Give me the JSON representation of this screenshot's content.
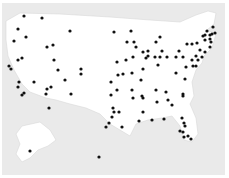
{
  "map": {
    "title": "",
    "region": "United States",
    "colors": {
      "background": "#eaeaea",
      "land": "#ffffff",
      "border": "#d8d8d8",
      "marker": "#111111"
    },
    "land_paths": {
      "conus": "M6,21 L20,13 L60,14 L110,17 L150,20 L180,22 L196,15 L208,11 L216,13 L214,24 L207,30 L216,34 L212,48 L204,56 L202,63 L196,70 L192,82 L194,96 L190,104 L196,118 L198,134 L192,142 L184,140 L180,126 L172,116 L162,118 L148,120 L136,124 L130,136 L120,130 L110,124 L100,114 L86,108 L70,104 L56,100 L46,98 L30,92 L22,84 L14,70 L8,56 L6,40 Z",
      "alaska": "M22,126 L40,122 L50,130 L56,140 L48,146 L38,150 L30,158 L22,162 L16,154 L20,144 L16,134 Z"
    },
    "markers": [
      {
        "x": 24,
        "y": 16
      },
      {
        "x": 42,
        "y": 18
      },
      {
        "x": 18,
        "y": 29
      },
      {
        "x": 70,
        "y": 31
      },
      {
        "x": 114,
        "y": 32
      },
      {
        "x": 14,
        "y": 41
      },
      {
        "x": 26,
        "y": 37
      },
      {
        "x": 47,
        "y": 47
      },
      {
        "x": 53,
        "y": 45
      },
      {
        "x": 54,
        "y": 60
      },
      {
        "x": 18,
        "y": 60
      },
      {
        "x": 22,
        "y": 58
      },
      {
        "x": 9,
        "y": 66
      },
      {
        "x": 11,
        "y": 69
      },
      {
        "x": 58,
        "y": 70
      },
      {
        "x": 81,
        "y": 69
      },
      {
        "x": 81,
        "y": 74
      },
      {
        "x": 65,
        "y": 80
      },
      {
        "x": 19,
        "y": 82
      },
      {
        "x": 18,
        "y": 87
      },
      {
        "x": 34,
        "y": 82
      },
      {
        "x": 51,
        "y": 87
      },
      {
        "x": 111,
        "y": 82
      },
      {
        "x": 131,
        "y": 31
      },
      {
        "x": 127,
        "y": 42
      },
      {
        "x": 134,
        "y": 42
      },
      {
        "x": 136,
        "y": 47
      },
      {
        "x": 143,
        "y": 52
      },
      {
        "x": 148,
        "y": 51
      },
      {
        "x": 156,
        "y": 42
      },
      {
        "x": 160,
        "y": 37
      },
      {
        "x": 148,
        "y": 56
      },
      {
        "x": 146,
        "y": 58
      },
      {
        "x": 155,
        "y": 57
      },
      {
        "x": 160,
        "y": 57
      },
      {
        "x": 162,
        "y": 51
      },
      {
        "x": 167,
        "y": 57
      },
      {
        "x": 176,
        "y": 57
      },
      {
        "x": 183,
        "y": 57
      },
      {
        "x": 179,
        "y": 51
      },
      {
        "x": 187,
        "y": 44
      },
      {
        "x": 192,
        "y": 44
      },
      {
        "x": 197,
        "y": 43
      },
      {
        "x": 203,
        "y": 36
      },
      {
        "x": 205,
        "y": 35
      },
      {
        "x": 205,
        "y": 40
      },
      {
        "x": 210,
        "y": 35
      },
      {
        "x": 210,
        "y": 39
      },
      {
        "x": 210,
        "y": 47
      },
      {
        "x": 205,
        "y": 52
      },
      {
        "x": 200,
        "y": 50
      },
      {
        "x": 196,
        "y": 56
      },
      {
        "x": 202,
        "y": 57
      },
      {
        "x": 198,
        "y": 60
      },
      {
        "x": 192,
        "y": 60
      },
      {
        "x": 193,
        "y": 66
      },
      {
        "x": 117,
        "y": 62
      },
      {
        "x": 126,
        "y": 60
      },
      {
        "x": 133,
        "y": 57
      },
      {
        "x": 118,
        "y": 75
      },
      {
        "x": 123,
        "y": 74
      },
      {
        "x": 132,
        "y": 73
      },
      {
        "x": 143,
        "y": 69
      },
      {
        "x": 158,
        "y": 65
      },
      {
        "x": 176,
        "y": 73
      },
      {
        "x": 185,
        "y": 79
      },
      {
        "x": 196,
        "y": 66
      },
      {
        "x": 211,
        "y": 42
      },
      {
        "x": 212,
        "y": 34
      },
      {
        "x": 207,
        "y": 31
      },
      {
        "x": 215,
        "y": 33
      },
      {
        "x": 213,
        "y": 27
      },
      {
        "x": 186,
        "y": 67
      },
      {
        "x": 141,
        "y": 80
      },
      {
        "x": 117,
        "y": 90
      },
      {
        "x": 132,
        "y": 90
      },
      {
        "x": 156,
        "y": 90
      },
      {
        "x": 142,
        "y": 96
      },
      {
        "x": 166,
        "y": 92
      },
      {
        "x": 183,
        "y": 94
      },
      {
        "x": 133,
        "y": 98
      },
      {
        "x": 143,
        "y": 98
      },
      {
        "x": 157,
        "y": 102
      },
      {
        "x": 168,
        "y": 100
      },
      {
        "x": 172,
        "y": 105
      },
      {
        "x": 183,
        "y": 96
      },
      {
        "x": 114,
        "y": 112
      },
      {
        "x": 119,
        "y": 112
      },
      {
        "x": 143,
        "y": 112
      },
      {
        "x": 139,
        "y": 121
      },
      {
        "x": 152,
        "y": 120
      },
      {
        "x": 164,
        "y": 119
      },
      {
        "x": 182,
        "y": 118
      },
      {
        "x": 184,
        "y": 123
      },
      {
        "x": 185,
        "y": 126
      },
      {
        "x": 180,
        "y": 131
      },
      {
        "x": 183,
        "y": 132
      },
      {
        "x": 184,
        "y": 137
      },
      {
        "x": 188,
        "y": 136
      },
      {
        "x": 191,
        "y": 139
      },
      {
        "x": 122,
        "y": 127
      },
      {
        "x": 22,
        "y": 95
      },
      {
        "x": 24,
        "y": 93
      },
      {
        "x": 47,
        "y": 89
      },
      {
        "x": 46,
        "y": 94
      },
      {
        "x": 49,
        "y": 108
      },
      {
        "x": 71,
        "y": 94
      },
      {
        "x": 111,
        "y": 95
      },
      {
        "x": 113,
        "y": 108
      },
      {
        "x": 112,
        "y": 117
      },
      {
        "x": 109,
        "y": 123
      },
      {
        "x": 106,
        "y": 127
      },
      {
        "x": 30,
        "y": 151
      },
      {
        "x": 99,
        "y": 157
      }
    ]
  }
}
